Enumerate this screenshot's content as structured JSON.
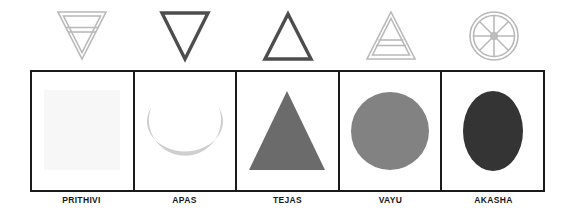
{
  "figure": {
    "colors": {
      "frame": "#1a1a1a",
      "label": "#171717",
      "symbol_light": "#b9b9b9",
      "symbol_dark": "#4d4d4d",
      "earth_fill": "#f7f7f7",
      "water_fill": "#cfcfcf",
      "fire_fill": "#6b6b6b",
      "air_fill": "#828282",
      "ether_fill": "#343434"
    }
  },
  "elements": [
    {
      "label": "PRITHIVI",
      "symbol_name": "down-triangle-with-bar-icon",
      "symbol_description": "downward triangle with horizontal bar",
      "symbol_color": "#b9b9b9",
      "shape_name": "square-shape",
      "shape_description": "square",
      "shape_color": "#f7f7f7"
    },
    {
      "label": "APAS",
      "symbol_name": "down-triangle-icon",
      "symbol_description": "downward triangle",
      "symbol_color": "#4d4d4d",
      "shape_name": "crescent-shape",
      "shape_description": "crescent moon",
      "shape_color": "#cfcfcf"
    },
    {
      "label": "TEJAS",
      "symbol_name": "up-triangle-icon",
      "symbol_description": "upward triangle",
      "symbol_color": "#4d4d4d",
      "shape_name": "triangle-shape",
      "shape_description": "triangle",
      "shape_color": "#6b6b6b"
    },
    {
      "label": "VAYU",
      "symbol_name": "up-triangle-with-bar-icon",
      "symbol_description": "upward triangle with horizontal bar",
      "symbol_color": "#b9b9b9",
      "shape_name": "circle-shape",
      "shape_description": "circle",
      "shape_color": "#828282"
    },
    {
      "label": "AKASHA",
      "symbol_name": "spoked-wheel-icon",
      "symbol_description": "wheel with eight spokes",
      "symbol_color": "#b9b9b9",
      "shape_name": "ellipse-shape",
      "shape_description": "vertical ellipse",
      "shape_color": "#343434"
    }
  ]
}
